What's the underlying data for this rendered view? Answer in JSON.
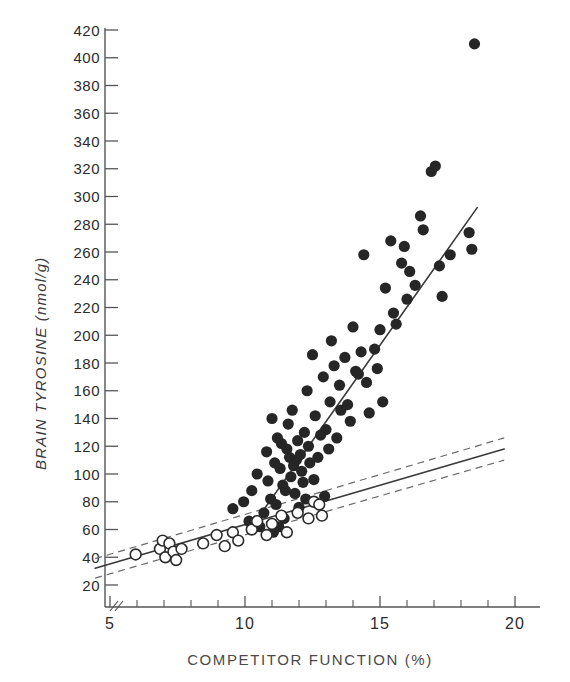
{
  "figure": {
    "background": "#ffffff",
    "ink_color": "#262626"
  },
  "chart_data": {
    "type": "scatter",
    "title": "",
    "xlabel": "COMPETITOR FUNCTION (%)",
    "ylabel": "BRAIN TYROSINE (nmol/g)",
    "xlim": [
      4.3,
      20.6
    ],
    "ylim": [
      14,
      428
    ],
    "grid": false,
    "legend_position": "none",
    "x_major_ticks": [
      5,
      10,
      15,
      20
    ],
    "x_major_tick_labels": [
      "5",
      "10",
      "15",
      "20"
    ],
    "x_minor_ticks": [
      6,
      7,
      8,
      9,
      11,
      12,
      13,
      14,
      16,
      17,
      18,
      19
    ],
    "y_ticks": [
      20,
      40,
      60,
      80,
      100,
      120,
      140,
      160,
      180,
      200,
      220,
      240,
      260,
      280,
      300,
      320,
      340,
      360,
      380,
      400,
      420
    ],
    "y_tick_labels": [
      "20",
      "40",
      "60",
      "80",
      "100",
      "120",
      "140",
      "160",
      "180",
      "200",
      "220",
      "240",
      "260",
      "280",
      "300",
      "320",
      "340",
      "360",
      "380",
      "400",
      "420"
    ],
    "axis_break": true,
    "series": [
      {
        "name": "filled-circles",
        "marker": "filled-circle",
        "color": "#262626",
        "points": [
          [
            9.55,
            75
          ],
          [
            9.95,
            80
          ],
          [
            10.15,
            66
          ],
          [
            10.35,
            64
          ],
          [
            10.45,
            100
          ],
          [
            10.55,
            62
          ],
          [
            10.7,
            72
          ],
          [
            10.8,
            116
          ],
          [
            10.85,
            95
          ],
          [
            10.95,
            82
          ],
          [
            11.0,
            140
          ],
          [
            11.05,
            58
          ],
          [
            11.1,
            108
          ],
          [
            11.15,
            78
          ],
          [
            11.2,
            126
          ],
          [
            11.3,
            104
          ],
          [
            11.35,
            122
          ],
          [
            11.4,
            92
          ],
          [
            11.45,
            68
          ],
          [
            11.5,
            88
          ],
          [
            11.55,
            118
          ],
          [
            11.6,
            136
          ],
          [
            11.65,
            112
          ],
          [
            11.7,
            98
          ],
          [
            11.75,
            146
          ],
          [
            11.8,
            106
          ],
          [
            11.85,
            86
          ],
          [
            11.9,
            110
          ],
          [
            11.95,
            124
          ],
          [
            12.0,
            76
          ],
          [
            12.05,
            114
          ],
          [
            12.1,
            102
          ],
          [
            12.15,
            94
          ],
          [
            12.2,
            130
          ],
          [
            12.3,
            160
          ],
          [
            12.35,
            120
          ],
          [
            12.4,
            108
          ],
          [
            12.5,
            186
          ],
          [
            12.55,
            96
          ],
          [
            12.6,
            142
          ],
          [
            12.7,
            112
          ],
          [
            12.8,
            128
          ],
          [
            12.9,
            170
          ],
          [
            13.0,
            132
          ],
          [
            13.1,
            118
          ],
          [
            13.15,
            152
          ],
          [
            13.2,
            196
          ],
          [
            13.3,
            178
          ],
          [
            13.4,
            126
          ],
          [
            13.5,
            164
          ],
          [
            13.55,
            146
          ],
          [
            13.7,
            184
          ],
          [
            13.8,
            150
          ],
          [
            13.9,
            138
          ],
          [
            14.0,
            206
          ],
          [
            14.1,
            174
          ],
          [
            14.2,
            172
          ],
          [
            14.3,
            188
          ],
          [
            14.4,
            258
          ],
          [
            14.5,
            166
          ],
          [
            14.6,
            144
          ],
          [
            14.8,
            190
          ],
          [
            14.9,
            176
          ],
          [
            15.0,
            204
          ],
          [
            15.1,
            152
          ],
          [
            15.2,
            234
          ],
          [
            15.4,
            268
          ],
          [
            15.5,
            216
          ],
          [
            15.6,
            208
          ],
          [
            15.8,
            252
          ],
          [
            15.9,
            264
          ],
          [
            16.0,
            226
          ],
          [
            16.1,
            246
          ],
          [
            16.3,
            236
          ],
          [
            16.5,
            286
          ],
          [
            16.6,
            276
          ],
          [
            16.9,
            318
          ],
          [
            17.05,
            322
          ],
          [
            17.2,
            250
          ],
          [
            17.3,
            228
          ],
          [
            17.6,
            258
          ],
          [
            18.3,
            274
          ],
          [
            18.4,
            262
          ],
          [
            18.5,
            410
          ],
          [
            12.95,
            84
          ],
          [
            12.25,
            82
          ],
          [
            11.25,
            62
          ],
          [
            10.25,
            88
          ]
        ]
      },
      {
        "name": "open-circles",
        "marker": "open-circle",
        "color": "#ffffff",
        "points": [
          [
            6.85,
            46
          ],
          [
            6.95,
            52
          ],
          [
            7.05,
            40
          ],
          [
            7.2,
            50
          ],
          [
            7.35,
            44
          ],
          [
            7.45,
            38
          ],
          [
            8.45,
            50
          ],
          [
            8.95,
            56
          ],
          [
            9.25,
            48
          ],
          [
            9.55,
            58
          ],
          [
            9.75,
            52
          ],
          [
            10.25,
            60
          ],
          [
            10.45,
            66
          ],
          [
            11.0,
            64
          ],
          [
            11.35,
            70
          ],
          [
            11.55,
            58
          ],
          [
            11.95,
            72
          ],
          [
            12.35,
            68
          ],
          [
            12.55,
            80
          ],
          [
            12.75,
            78
          ],
          [
            12.85,
            70
          ],
          [
            5.95,
            42
          ],
          [
            7.65,
            46
          ],
          [
            10.8,
            56
          ]
        ]
      }
    ],
    "fit_lines": [
      {
        "name": "steep-regression-line",
        "style": "solid",
        "x0": 10.25,
        "y0": 62,
        "x1": 18.6,
        "y1": 292
      },
      {
        "name": "shallow-regression-line",
        "style": "solid",
        "x0": 4.45,
        "y0": 32,
        "x1": 19.6,
        "y1": 118
      },
      {
        "name": "upper-confidence-band",
        "style": "dashed",
        "x0": 4.45,
        "y0": 39,
        "x1": 19.6,
        "y1": 126
      },
      {
        "name": "lower-confidence-band",
        "style": "dashed",
        "x0": 4.45,
        "y0": 25,
        "x1": 19.6,
        "y1": 110
      }
    ]
  }
}
